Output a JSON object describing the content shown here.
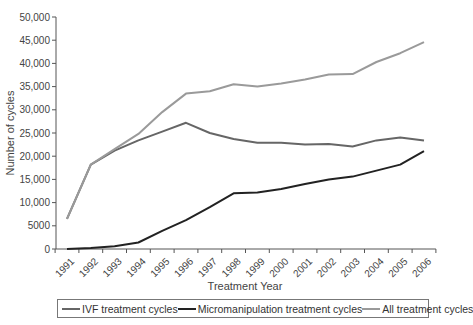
{
  "chart_data": {
    "type": "line",
    "title": "",
    "xlabel": "Treatment Year",
    "ylabel": "Number of cycles",
    "ylim": [
      0,
      50000
    ],
    "yticks": [
      0,
      5000,
      10000,
      15000,
      20000,
      25000,
      30000,
      35000,
      40000,
      45000,
      50000
    ],
    "ytick_labels": [
      "0",
      "5000",
      "10,000",
      "15,000",
      "20,000",
      "25,000",
      "30,000",
      "35,000",
      "40,000",
      "45,000",
      "50,000"
    ],
    "grid": false,
    "legend_position": "bottom",
    "x": [
      "1991",
      "1992",
      "1993",
      "1994",
      "1995",
      "1996",
      "1997",
      "1998",
      "1999",
      "2000",
      "2001",
      "2002",
      "2003",
      "2004",
      "2005",
      "2006"
    ],
    "series": [
      {
        "name": "IVF treatment cycles",
        "color": "#666666",
        "values": [
          6500,
          18200,
          21200,
          23400,
          25300,
          27200,
          25000,
          23700,
          22900,
          22900,
          22500,
          22600,
          22100,
          23400,
          24000,
          23400
        ]
      },
      {
        "name": "Micromanipulation treatment cycles",
        "color": "#222222",
        "values": [
          0,
          200,
          600,
          1400,
          3900,
          6200,
          9000,
          12000,
          12200,
          12900,
          14000,
          15000,
          15600,
          16900,
          18200,
          21100
        ]
      },
      {
        "name": "All treatment cycles",
        "color": "#9a9a9a",
        "values": [
          6500,
          18200,
          21500,
          24800,
          29500,
          33500,
          34000,
          35500,
          35000,
          35700,
          36500,
          37600,
          37700,
          40300,
          42200,
          44600
        ]
      }
    ]
  },
  "legend": {
    "items": [
      {
        "label": "IVF treatment cycles",
        "color": "#666666"
      },
      {
        "label": "Micromanipulation treatment cycles",
        "color": "#222222"
      },
      {
        "label": "All treatment cycles",
        "color": "#9a9a9a"
      }
    ]
  }
}
